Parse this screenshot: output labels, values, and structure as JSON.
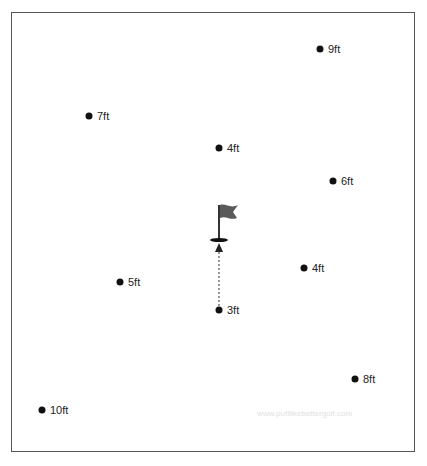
{
  "diagram": {
    "hole": {
      "x": 219,
      "y": 240
    },
    "path": {
      "from": {
        "x": 219,
        "y": 309
      },
      "to": {
        "x": 219,
        "y": 244
      }
    },
    "balls": [
      {
        "label": "9ft",
        "x": 320,
        "y": 49
      },
      {
        "label": "7ft",
        "x": 89,
        "y": 116
      },
      {
        "label": "4ft",
        "x": 219,
        "y": 148
      },
      {
        "label": "6ft",
        "x": 333,
        "y": 181
      },
      {
        "label": "4ft",
        "x": 304,
        "y": 268
      },
      {
        "label": "5ft",
        "x": 120,
        "y": 282
      },
      {
        "label": "3ft",
        "x": 219,
        "y": 310
      },
      {
        "label": "8ft",
        "x": 355,
        "y": 379
      },
      {
        "label": "10ft",
        "x": 42,
        "y": 410
      }
    ],
    "watermark": "www.puttlikebettergolf.com",
    "colors": {
      "ball": "#111111",
      "flag": "#5a5a5a",
      "border": "#555555"
    }
  }
}
